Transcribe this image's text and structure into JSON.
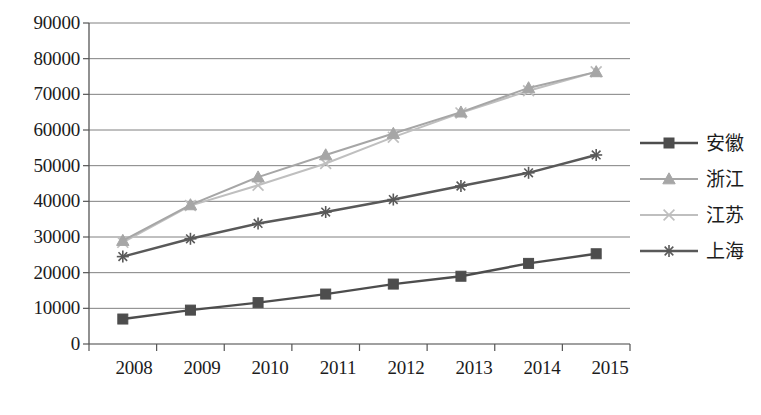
{
  "chart_data": {
    "type": "line",
    "title": "",
    "subtitle": "",
    "xlabel": "",
    "ylabel": "",
    "categories": [
      "2008",
      "2009",
      "2010",
      "2011",
      "2012",
      "2013",
      "2014",
      "2015"
    ],
    "ylim": [
      0,
      90000
    ],
    "ytick_step": 10000,
    "yticks": [
      "90000",
      "80000",
      "70000",
      "60000",
      "50000",
      "40000",
      "30000",
      "20000",
      "10000",
      "0"
    ],
    "grid": "horizontal",
    "legend_position": "right",
    "series": [
      {
        "name": "安徽",
        "marker": "square",
        "color": "#4d4d4d",
        "values": [
          7000,
          9500,
          11600,
          14000,
          16800,
          19000,
          22600,
          25300
        ]
      },
      {
        "name": "浙江",
        "marker": "triangle",
        "color": "#a6a6a6",
        "values": [
          29000,
          39000,
          46800,
          53000,
          59000,
          65000,
          71800,
          76300
        ]
      },
      {
        "name": "江苏",
        "marker": "x",
        "color": "#bfbfbf",
        "values": [
          28500,
          38800,
          44500,
          50600,
          58000,
          64800,
          71000,
          76300
        ]
      },
      {
        "name": "上海",
        "marker": "asterisk",
        "color": "#595959",
        "values": [
          24500,
          29500,
          33800,
          37000,
          40500,
          44300,
          48000,
          53000
        ]
      }
    ]
  },
  "legend": {
    "items": [
      {
        "label": "安徽"
      },
      {
        "label": "浙江"
      },
      {
        "label": "江苏"
      },
      {
        "label": "上海"
      }
    ]
  }
}
